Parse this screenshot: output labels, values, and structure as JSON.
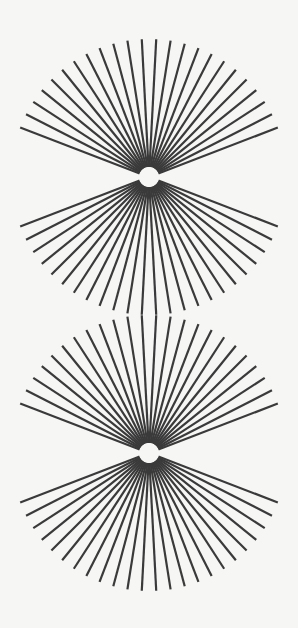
{
  "image": {
    "description": "Two identical radial fan figures stacked vertically, each with an upper and lower fan of straight lines radiating from a small white circle",
    "background_color": "#f6f6f5",
    "line_color": "#3a3a3a",
    "circle_color": "#f6f6f5"
  },
  "figures": [
    {
      "cx": 149,
      "cy": 177,
      "inner_radius": 10,
      "outer_radius": 138,
      "lines_per_fan": 24,
      "angle_step_deg": 6,
      "first_offset_deg": 3,
      "stroke_width": 2.2
    },
    {
      "cx": 149,
      "cy": 453,
      "inner_radius": 10,
      "outer_radius": 138,
      "lines_per_fan": 24,
      "angle_step_deg": 6,
      "first_offset_deg": 3,
      "stroke_width": 2.2
    }
  ]
}
